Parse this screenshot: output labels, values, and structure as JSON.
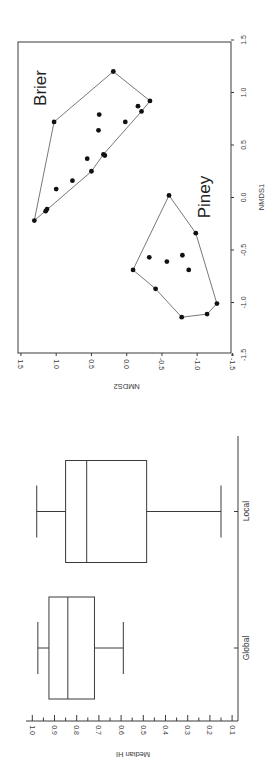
{
  "figure": {
    "orientation": "rotated 90 degrees clockwise",
    "colors": {
      "axis": "#3a3a3a",
      "points": "#111111",
      "hull": "#555555",
      "background": "#ffffff"
    }
  },
  "chart_data": [
    {
      "type": "scatter",
      "title": "",
      "xlabel": "NMDS1",
      "ylabel": "NMDS2",
      "xlim": [
        -1.5,
        1.5
      ],
      "ylim": [
        -1.5,
        1.5
      ],
      "xticks": [
        "-1.5",
        "-1.0",
        "-0.5",
        "0.0",
        "0.5",
        "1.0",
        "1.5"
      ],
      "yticks": [
        "-1.5",
        "-1.0",
        "-0.5",
        "0.0",
        "0.5",
        "1.0",
        "1.5"
      ],
      "grid": false,
      "annotations": [
        "Brier",
        "Piney"
      ],
      "convex_hulls": true,
      "series": [
        {
          "name": "Brier",
          "points": [
            {
              "x": 1.2,
              "y": 0.19
            },
            {
              "x": 0.92,
              "y": -0.33
            },
            {
              "x": 0.87,
              "y": -0.16
            },
            {
              "x": 0.82,
              "y": -0.21
            },
            {
              "x": 0.72,
              "y": 1.03
            },
            {
              "x": 0.79,
              "y": 0.39
            },
            {
              "x": 0.64,
              "y": 0.4
            },
            {
              "x": 0.72,
              "y": 0.02
            },
            {
              "x": 0.41,
              "y": 0.33
            },
            {
              "x": 0.4,
              "y": 0.31
            },
            {
              "x": 0.37,
              "y": 0.56
            },
            {
              "x": 0.25,
              "y": 0.5
            },
            {
              "x": 0.16,
              "y": 0.77
            },
            {
              "x": 0.08,
              "y": 1.0
            },
            {
              "x": -0.11,
              "y": 1.13
            },
            {
              "x": -0.13,
              "y": 1.15
            },
            {
              "x": -0.22,
              "y": 1.31
            }
          ],
          "hull": [
            {
              "x": -0.22,
              "y": 1.31
            },
            {
              "x": 0.72,
              "y": 1.03
            },
            {
              "x": 1.2,
              "y": 0.19
            },
            {
              "x": 0.92,
              "y": -0.33
            },
            {
              "x": 0.82,
              "y": -0.21
            },
            {
              "x": 0.41,
              "y": 0.33
            },
            {
              "x": 0.25,
              "y": 0.5
            },
            {
              "x": -0.22,
              "y": 1.31
            }
          ]
        },
        {
          "name": "Piney",
          "points": [
            {
              "x": 0.02,
              "y": -0.6
            },
            {
              "x": -0.34,
              "y": -0.98
            },
            {
              "x": -0.57,
              "y": -0.32
            },
            {
              "x": -0.61,
              "y": -0.57
            },
            {
              "x": -0.55,
              "y": -0.79
            },
            {
              "x": -0.69,
              "y": -0.88
            },
            {
              "x": -0.69,
              "y": -0.09
            },
            {
              "x": -0.87,
              "y": -0.41
            },
            {
              "x": -1.01,
              "y": -1.28
            },
            {
              "x": -1.11,
              "y": -1.14
            },
            {
              "x": -1.14,
              "y": -0.78
            }
          ],
          "hull": [
            {
              "x": 0.02,
              "y": -0.6
            },
            {
              "x": -0.34,
              "y": -0.98
            },
            {
              "x": -1.01,
              "y": -1.28
            },
            {
              "x": -1.11,
              "y": -1.14
            },
            {
              "x": -1.14,
              "y": -0.78
            },
            {
              "x": -0.87,
              "y": -0.41
            },
            {
              "x": -0.69,
              "y": -0.09
            },
            {
              "x": 0.02,
              "y": -0.6
            }
          ]
        }
      ]
    },
    {
      "type": "box",
      "title": "",
      "xlabel": "",
      "ylabel": "Median HI",
      "ylim": [
        0.1,
        1.0
      ],
      "yticks": [
        "0.1",
        "0.2",
        "0.3",
        "0.4",
        "0.5",
        "0.6",
        "0.7",
        "0.8",
        "0.9",
        "1.0"
      ],
      "categories": [
        "Global",
        "Local"
      ],
      "series": [
        {
          "name": "Global",
          "whisker_low": 0.59,
          "q1": 0.72,
          "median": 0.84,
          "q3": 0.925,
          "whisker_high": 0.975
        },
        {
          "name": "Local",
          "whisker_low": 0.15,
          "q1": 0.485,
          "median": 0.755,
          "q3": 0.85,
          "whisker_high": 0.98
        }
      ]
    }
  ]
}
